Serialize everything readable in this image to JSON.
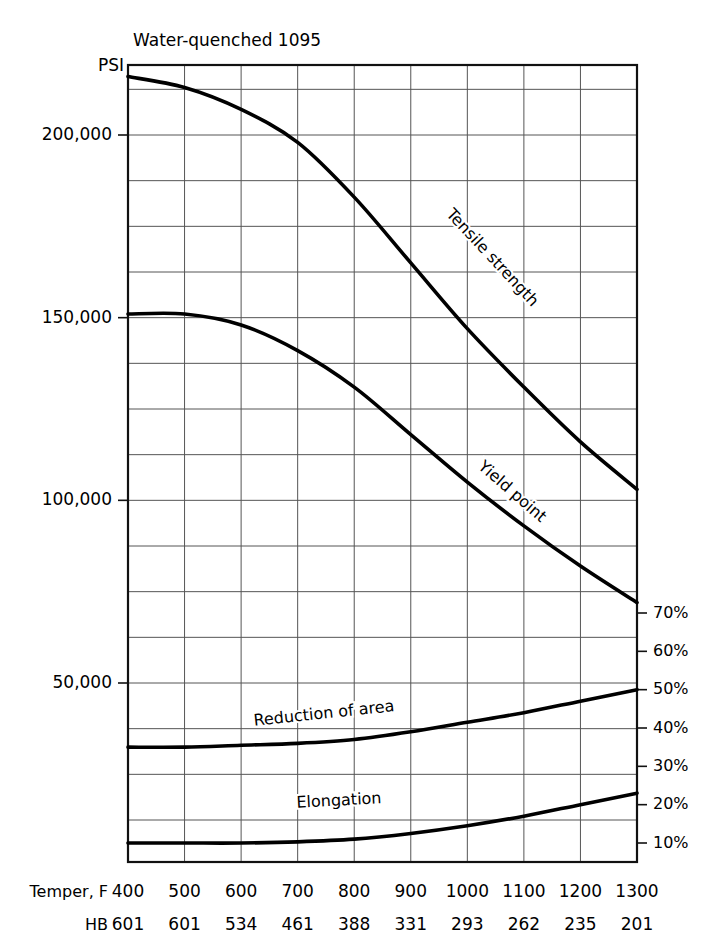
{
  "title": "Water-quenched 1095",
  "axes": {
    "left_unit_label": "PSI",
    "left_ticks": [
      {
        "value": 200000,
        "label": "200,000"
      },
      {
        "value": 150000,
        "label": "150,000"
      },
      {
        "value": 100000,
        "label": "100,000"
      },
      {
        "value": 50000,
        "label": "50,000"
      }
    ],
    "right_ticks": [
      {
        "value": 70,
        "label": "70%"
      },
      {
        "value": 60,
        "label": "60%"
      },
      {
        "value": 50,
        "label": "50%"
      },
      {
        "value": 40,
        "label": "40%"
      },
      {
        "value": 30,
        "label": "30%"
      },
      {
        "value": 20,
        "label": "20%"
      },
      {
        "value": 10,
        "label": "10%"
      }
    ],
    "bottom_rows": [
      {
        "row_label": "Temper, F",
        "values": [
          "400",
          "500",
          "600",
          "700",
          "800",
          "900",
          "1000",
          "1100",
          "1200",
          "1300"
        ]
      },
      {
        "row_label": "HB",
        "values": [
          "601",
          "601",
          "534",
          "461",
          "388",
          "331",
          "293",
          "262",
          "235",
          "201"
        ]
      }
    ]
  },
  "chart_data": {
    "type": "line",
    "title": "Water-quenched 1095",
    "xlabel": "Temper, F",
    "ylabel": "PSI",
    "y2label": "%",
    "grid": true,
    "legend": "inline-curve-labels",
    "x": [
      400,
      500,
      600,
      700,
      800,
      900,
      1000,
      1100,
      1200,
      1300
    ],
    "hardness_hb": [
      601,
      601,
      534,
      461,
      388,
      331,
      293,
      262,
      235,
      201
    ],
    "ylim": [
      0,
      225000
    ],
    "y2lim": [
      0,
      80
    ],
    "xlim": [
      400,
      1300
    ],
    "series": [
      {
        "name": "Tensile strength",
        "axis": "left",
        "unit": "PSI",
        "values": [
          216000,
          213000,
          207000,
          198000,
          183000,
          165000,
          147000,
          131000,
          116000,
          103000
        ]
      },
      {
        "name": "Yield point",
        "axis": "left",
        "unit": "PSI",
        "values": [
          151000,
          151000,
          148000,
          141000,
          131000,
          118000,
          105000,
          93000,
          82000,
          72000
        ]
      },
      {
        "name": "Reduction of area",
        "axis": "right",
        "unit": "%",
        "values": [
          35,
          35,
          35.5,
          36,
          37,
          39,
          41.5,
          44,
          47,
          50
        ]
      },
      {
        "name": "Elongation",
        "axis": "right",
        "unit": "%",
        "values": [
          10,
          10,
          10,
          10.3,
          11,
          12.5,
          14.5,
          17,
          20,
          23
        ]
      }
    ],
    "annotations": [
      {
        "text": "Tensile strength",
        "rotation": 47
      },
      {
        "text": "Yield point",
        "rotation": 41
      },
      {
        "text": "Reduction of area",
        "rotation": -6
      },
      {
        "text": "Elongation",
        "rotation": -3
      }
    ]
  }
}
